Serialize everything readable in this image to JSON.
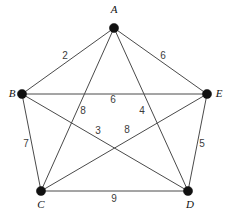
{
  "figure": {
    "name": "weighted-graph-k5",
    "width": 234,
    "height": 215,
    "background_color": "#ffffff",
    "edge_color": "#4a4a4a",
    "vertex_color": "#111111",
    "label_color": "#111111",
    "weight_color": "#3c3c3c"
  },
  "vertices": [
    {
      "id": "A",
      "label": "A",
      "x": 114,
      "y": 28,
      "label_x": 114,
      "label_y": 13,
      "label_anchor": "middle"
    },
    {
      "id": "B",
      "label": "B",
      "x": 22,
      "y": 94,
      "label_x": 12,
      "label_y": 97,
      "label_anchor": "middle"
    },
    {
      "id": "E",
      "label": "E",
      "x": 207,
      "y": 94,
      "label_x": 219,
      "label_y": 97,
      "label_anchor": "middle"
    },
    {
      "id": "C",
      "label": "C",
      "x": 41,
      "y": 191,
      "label_x": 41,
      "label_y": 208,
      "label_anchor": "middle"
    },
    {
      "id": "D",
      "label": "D",
      "x": 188,
      "y": 191,
      "label_x": 190,
      "label_y": 208,
      "label_anchor": "middle"
    }
  ],
  "edges": [
    {
      "id": "AB",
      "from": "A",
      "to": "B",
      "weight": "2",
      "weight_x": 65,
      "weight_y": 59
    },
    {
      "id": "AE",
      "from": "A",
      "to": "E",
      "weight": "6",
      "weight_x": 163,
      "weight_y": 59
    },
    {
      "id": "BE",
      "from": "B",
      "to": "E",
      "weight": "6",
      "weight_x": 113,
      "weight_y": 103
    },
    {
      "id": "AC",
      "from": "A",
      "to": "C",
      "weight": "8",
      "weight_x": 83,
      "weight_y": 114
    },
    {
      "id": "AD",
      "from": "A",
      "to": "D",
      "weight": "4",
      "weight_x": 142,
      "weight_y": 114
    },
    {
      "id": "BD",
      "from": "B",
      "to": "D",
      "weight": "3",
      "weight_x": 98,
      "weight_y": 134
    },
    {
      "id": "CE",
      "from": "C",
      "to": "E",
      "weight": "8",
      "weight_x": 127,
      "weight_y": 133
    },
    {
      "id": "BC",
      "from": "B",
      "to": "C",
      "weight": "7",
      "weight_x": 26,
      "weight_y": 147
    },
    {
      "id": "DE",
      "from": "D",
      "to": "E",
      "weight": "5",
      "weight_x": 202,
      "weight_y": 147
    },
    {
      "id": "CD",
      "from": "C",
      "to": "D",
      "weight": "9",
      "weight_x": 114,
      "weight_y": 202
    }
  ]
}
